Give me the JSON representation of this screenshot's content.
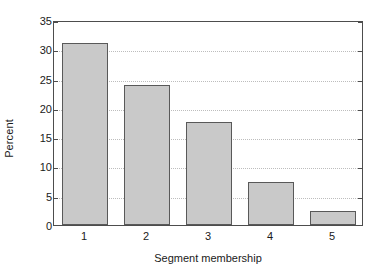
{
  "chart_data": {
    "type": "bar",
    "title": "",
    "subtitle": "",
    "categories": [
      "1",
      "2",
      "3",
      "4",
      "5"
    ],
    "values": [
      31.1,
      23.9,
      17.6,
      7.3,
      2.4
    ],
    "xlabel": "Segment membership",
    "ylabel": "Percent",
    "ylim": [
      0,
      35
    ],
    "yticks": [
      0,
      5,
      10,
      15,
      20,
      25,
      30,
      35
    ],
    "ytick_labels": [
      "0",
      "5",
      "10",
      "15",
      "20",
      "25",
      "30",
      "35"
    ],
    "grid": "horizontal-dotted",
    "legend": "none",
    "bar_fill_color": "#c9c9c9",
    "bar_edge_color": "#595959",
    "axis_color": "#4d4d4d",
    "grid_color": "#bdbdbd",
    "background_color": "#ffffff"
  }
}
